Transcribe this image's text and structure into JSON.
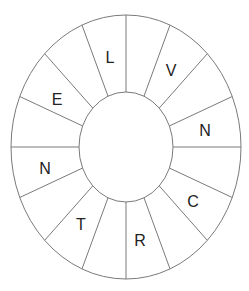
{
  "diagram": {
    "type": "letter-wheel",
    "segment_count": 16,
    "outer_ellipse": {
      "cx": 126,
      "cy": 147,
      "rx": 115,
      "ry": 132
    },
    "inner_ellipse": {
      "cx": 126,
      "cy": 147,
      "rx": 47,
      "ry": 55
    },
    "line_color": "#7a7a7a",
    "letter_color": "#222222",
    "segments": [
      {
        "index": 0,
        "letter": ""
      },
      {
        "index": 1,
        "letter": "V"
      },
      {
        "index": 2,
        "letter": ""
      },
      {
        "index": 3,
        "letter": "N"
      },
      {
        "index": 4,
        "letter": ""
      },
      {
        "index": 5,
        "letter": "C"
      },
      {
        "index": 6,
        "letter": ""
      },
      {
        "index": 7,
        "letter": "R"
      },
      {
        "index": 8,
        "letter": ""
      },
      {
        "index": 9,
        "letter": "T"
      },
      {
        "index": 10,
        "letter": ""
      },
      {
        "index": 11,
        "letter": "N"
      },
      {
        "index": 12,
        "letter": ""
      },
      {
        "index": 13,
        "letter": "E"
      },
      {
        "index": 14,
        "letter": ""
      },
      {
        "index": 15,
        "letter": "L"
      }
    ],
    "letters": {
      "top": "L",
      "top_right": "V",
      "right": "N",
      "bottom_right": "C",
      "bottom": "R",
      "bottom_left": "T",
      "left": "N",
      "top_left": "E"
    }
  }
}
